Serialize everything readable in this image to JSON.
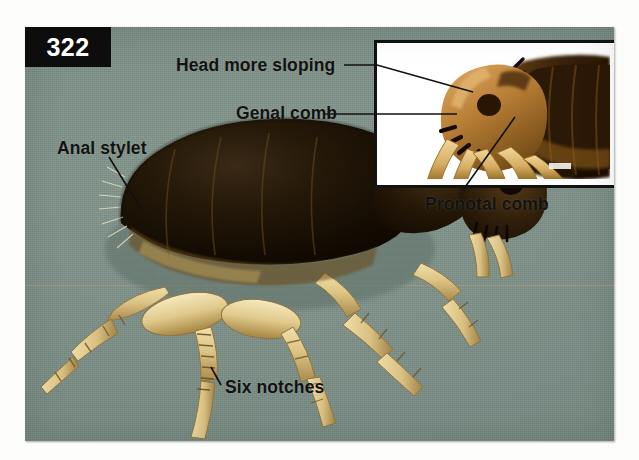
{
  "figure": {
    "number": "322",
    "caption_alt": "Flea specimen with labeled morphological features"
  },
  "photo": {
    "background_color": "#7e9189",
    "kind": "photomicrograph",
    "subject": "flea-lateral-view"
  },
  "inset": {
    "background_color": "#ffffff",
    "border_color": "#121212",
    "subject": "flea-head-closeup"
  },
  "labels": [
    {
      "id": "head-more-sloping",
      "text": "Head more sloping"
    },
    {
      "id": "genal-comb",
      "text": "Genal comb"
    },
    {
      "id": "anal-stylet",
      "text": "Anal stylet"
    },
    {
      "id": "pronotal-comb",
      "text": "Pronotal comb"
    },
    {
      "id": "six-notches",
      "text": "Six notches"
    }
  ],
  "colors": {
    "label_text": "#121212",
    "badge_background": "#0d0d0d",
    "badge_text": "#ffffff",
    "leader_line": "#101010",
    "photo_background": "#7e9189",
    "inset_background": "#ffffff",
    "page_background": "#fdfdfb"
  }
}
